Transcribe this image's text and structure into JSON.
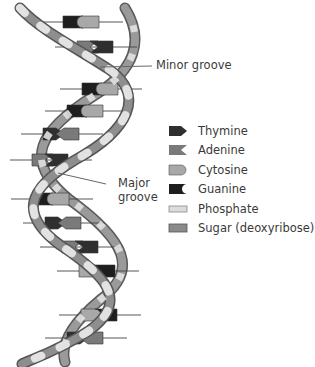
{
  "diagram": {
    "labels": {
      "minor_groove": "Minor groove",
      "major_groove_line1": "Major",
      "major_groove_line2": "groove"
    },
    "legend": [
      {
        "key": "thymine",
        "label": "Thymine",
        "color": "#2f2f2f"
      },
      {
        "key": "adenine",
        "label": "Adenine",
        "color": "#7a7a7a"
      },
      {
        "key": "cytosine",
        "label": "Cytosine",
        "color": "#a8a8a8"
      },
      {
        "key": "guanine",
        "label": "Guanine",
        "color": "#1e1e1e"
      },
      {
        "key": "phosphate",
        "label": "Phosphate",
        "color": "#dcdcdc"
      },
      {
        "key": "sugar",
        "label": "Sugar (deoxyribose)",
        "color": "#8a8a8a"
      }
    ],
    "base_pairs": [
      {
        "y": 22,
        "x": 63,
        "left": "guanine",
        "right": "cytosine"
      },
      {
        "y": 47,
        "x": 77,
        "left": "adenine",
        "right": "thymine"
      },
      {
        "y": 89,
        "x": 82,
        "left": "guanine",
        "right": "cytosine"
      },
      {
        "y": 111,
        "x": 67,
        "left": "guanine",
        "right": "cytosine"
      },
      {
        "y": 134,
        "x": 43,
        "left": "thymine",
        "right": "adenine"
      },
      {
        "y": 160,
        "x": 32,
        "left": "adenine",
        "right": "thymine"
      },
      {
        "y": 199,
        "x": 33,
        "left": "guanine",
        "right": "cytosine"
      },
      {
        "y": 223,
        "x": 45,
        "left": "thymine",
        "right": "adenine"
      },
      {
        "y": 247,
        "x": 62,
        "left": "adenine",
        "right": "thymine"
      },
      {
        "y": 271,
        "x": 79,
        "left": "cytosine",
        "right": "guanine"
      },
      {
        "y": 315,
        "x": 81,
        "left": "cytosine",
        "right": "guanine"
      },
      {
        "y": 338,
        "x": 67,
        "left": "thymine",
        "right": "adenine"
      }
    ]
  }
}
